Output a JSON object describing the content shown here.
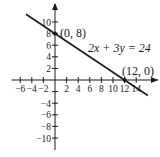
{
  "chart_data": {
    "type": "line",
    "title": "",
    "xlabel": "",
    "ylabel": "",
    "xlim": [
      -7,
      15
    ],
    "ylim": [
      -11,
      11
    ],
    "grid": false,
    "x_ticks": [
      -6,
      -4,
      -2,
      2,
      4,
      6,
      8,
      10,
      12,
      14
    ],
    "y_ticks": [
      10,
      8,
      6,
      4,
      2,
      -4,
      -6,
      -8,
      -10
    ],
    "x_tick_labels": [
      "−6",
      "−4",
      "−2",
      "2",
      "4",
      "6",
      "8",
      "10",
      "12",
      "14"
    ],
    "y_tick_labels": [
      "10",
      "8",
      "6",
      "4",
      "2",
      "−4",
      "−6",
      "−8",
      "−10"
    ],
    "series": [
      {
        "name": "2x + 3y = 24",
        "equation": "2x + 3y = 24",
        "x": [
          -5,
          16
        ],
        "y": [
          11.33,
          -2.67
        ]
      }
    ],
    "annotations": [
      {
        "text": "(0, 8)",
        "x": 0,
        "y": 8
      },
      {
        "text": "(12, 0)",
        "x": 12,
        "y": 0
      },
      {
        "text": "2x + 3y = 24",
        "x": 6,
        "y": 5
      }
    ],
    "points": [
      {
        "x": 0,
        "y": 8,
        "label": "(0, 8)"
      },
      {
        "x": 12,
        "y": 0,
        "label": "(12, 0)"
      }
    ]
  },
  "labels": {
    "equation": "2x + 3y = 24",
    "point_y_intercept": "(0, 8)",
    "point_x_intercept": "(12, 0)"
  }
}
